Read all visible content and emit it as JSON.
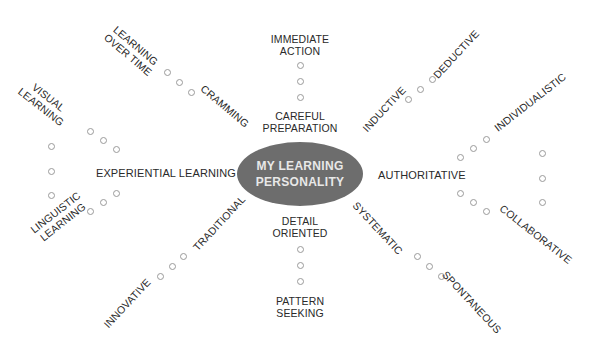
{
  "center": {
    "line1": "MY LEARNING",
    "line2": "PERSONALITY",
    "fill": "#6d6d6d",
    "text_color": "#e8e8e8"
  },
  "dimensions": [
    {
      "id": "action",
      "pole_a": [
        "IMMEDIATE",
        "ACTION"
      ],
      "pole_b": [
        "CAREFUL",
        "PREPARATION"
      ],
      "scale_points": 3
    },
    {
      "id": "detail",
      "pole_a": [
        "DETAIL",
        "ORIENTED"
      ],
      "pole_b": [
        "PATTERN",
        "SEEKING"
      ],
      "scale_points": 3
    },
    {
      "id": "timing",
      "pole_a": [
        "LEARNING",
        "OVER TIME"
      ],
      "pole_b": [
        "CRAMMING"
      ],
      "scale_points": 3
    },
    {
      "id": "reasoning",
      "pole_a": [
        "INDUCTIVE"
      ],
      "pole_b": [
        "DEDUCTIVE"
      ],
      "scale_points": 3
    },
    {
      "id": "tradition",
      "pole_a": [
        "INNOVATIVE"
      ],
      "pole_b": [
        "TRADITIONAL"
      ],
      "scale_points": 3
    },
    {
      "id": "structure",
      "pole_a": [
        "SYSTEMATIC"
      ],
      "pole_b": [
        "SPONTANEOUS"
      ],
      "scale_points": 3
    },
    {
      "id": "experiential",
      "hub": "EXPERIENTIAL LEARNING",
      "pole_a": [
        "VISUAL",
        "LEARNING"
      ],
      "pole_b": [
        "LINGUISTIC",
        "LEARNING"
      ],
      "scale_points": 3
    },
    {
      "id": "authority",
      "hub": "AUTHORITATIVE",
      "pole_a": [
        "INDIVIDUALISTIC"
      ],
      "pole_b": [
        "COLLABORATIVE"
      ],
      "scale_points": 3
    }
  ],
  "colors": {
    "dot_stroke": "#9a9a9a",
    "text": "#2a2a2a",
    "background": "#ffffff"
  }
}
